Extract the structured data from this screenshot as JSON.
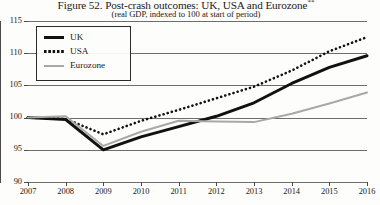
{
  "figure": {
    "title": "Figure 52. Post-crash outcomes: UK, USA and Eurozone",
    "title_superscript": "**",
    "subtitle": "(real GDP, indexed to 100 at start of period)"
  },
  "legend": {
    "position": "top-left-inside",
    "items": [
      {
        "label": "UK",
        "swatch": "thick-solid-black-line",
        "color": "#111111"
      },
      {
        "label": "USA",
        "swatch": "dotted-black-line",
        "color": "#111111"
      },
      {
        "label": "Eurozone",
        "swatch": "solid-gray-line",
        "color": "#a8a8a8"
      }
    ]
  },
  "chart_data": {
    "type": "line",
    "title": "Figure 52. Post-crash outcomes: UK, USA and Eurozone",
    "subtitle": "(real GDP, indexed to 100 at start of period)",
    "xlabel": "",
    "ylabel": "",
    "grid": true,
    "legend_position": "upper left",
    "x": [
      2007,
      2008,
      2009,
      2010,
      2011,
      2012,
      2013,
      2014,
      2015,
      2016
    ],
    "xlim": [
      2007,
      2016
    ],
    "ylim": [
      90,
      115
    ],
    "xticks": [
      "2007",
      "2008",
      "2009",
      "2010",
      "2011",
      "2012",
      "2013",
      "2014",
      "2015",
      "2016"
    ],
    "yticks": [
      "90",
      "95",
      "100",
      "105",
      "110",
      "115"
    ],
    "series": [
      {
        "name": "UK",
        "color": "#111111",
        "style": "solid",
        "width": 3,
        "values": [
          100.0,
          99.7,
          95.0,
          97.0,
          98.6,
          100.2,
          102.3,
          105.3,
          107.8,
          109.6
        ]
      },
      {
        "name": "USA",
        "color": "#111111",
        "style": "dotted",
        "width": 2.6,
        "values": [
          100.0,
          99.8,
          97.4,
          99.5,
          101.2,
          103.0,
          104.8,
          107.3,
          110.3,
          112.5
        ]
      },
      {
        "name": "Eurozone",
        "color": "#a8a8a8",
        "style": "solid",
        "width": 2,
        "values": [
          100.0,
          100.2,
          95.6,
          97.8,
          99.5,
          99.4,
          99.3,
          100.6,
          102.2,
          103.9
        ]
      }
    ]
  }
}
